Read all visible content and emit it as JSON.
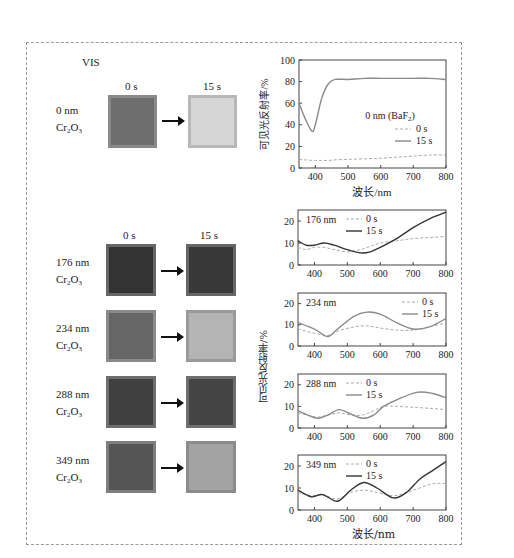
{
  "figure": {
    "mode_label": "VIS",
    "time_labels": {
      "t0": "0 s",
      "t1": "15 s"
    },
    "material": "Cr2O3",
    "material_main": "Cr",
    "material_sub1": "2",
    "material_mid": "O",
    "material_sub2": "3",
    "samples": [
      {
        "thickness": "0 nm",
        "before_color": "#6e6e6e",
        "before_border": "#8a8a8a",
        "after_color": "#d6d6d6",
        "after_border": "#b8b8b8"
      },
      {
        "thickness": "176 nm",
        "before_color": "#333333",
        "before_border": "#666666",
        "after_color": "#383838",
        "after_border": "#666666"
      },
      {
        "thickness": "234 nm",
        "before_color": "#666666",
        "before_border": "#8a8a8a",
        "after_color": "#b4b4b4",
        "after_border": "#9a9a9a"
      },
      {
        "thickness": "288 nm",
        "before_color": "#404040",
        "before_border": "#6e6e6e",
        "after_color": "#444444",
        "after_border": "#6e6e6e"
      },
      {
        "thickness": "349 nm",
        "before_color": "#555555",
        "before_border": "#7e7e7e",
        "after_color": "#a3a3a3",
        "after_border": "#8c8c8c"
      }
    ],
    "ylabel": "可见光反射率/%",
    "xlabel": "波长/nm"
  },
  "chart_data": [
    {
      "type": "line",
      "title": "0 nm (BaF2)",
      "title_main": "0 nm (BaF",
      "title_sub": "2",
      "title_end": ")",
      "xlabel": "波长/nm",
      "ylabel": "可见光反射率/%",
      "xlim": [
        350,
        800
      ],
      "ylim": [
        0,
        100
      ],
      "xticks": [
        "400",
        "500",
        "600",
        "700",
        "800"
      ],
      "yticks": [
        "0",
        "20",
        "40",
        "60",
        "80",
        "100"
      ],
      "x": [
        350,
        370,
        390,
        400,
        420,
        440,
        460,
        500,
        550,
        600,
        650,
        700,
        750,
        800
      ],
      "series": [
        {
          "name": "0 s",
          "style": "dashed",
          "values": [
            8,
            7.5,
            7,
            7,
            7,
            7,
            7.5,
            8,
            8.5,
            9,
            10,
            11,
            12,
            12
          ]
        },
        {
          "name": "15 s",
          "style": "solid",
          "values": [
            60,
            45,
            34,
            40,
            65,
            78,
            82,
            82,
            83,
            83,
            83,
            83,
            83,
            82
          ]
        }
      ],
      "legend": [
        "0 s",
        "15 s"
      ]
    },
    {
      "type": "line",
      "title": "176 nm",
      "xlim": [
        350,
        800
      ],
      "ylim": [
        0,
        25
      ],
      "xticks": [
        "400",
        "500",
        "600",
        "700",
        "800"
      ],
      "yticks": [
        "0",
        "10",
        "20"
      ],
      "x": [
        350,
        375,
        400,
        430,
        460,
        500,
        540,
        570,
        600,
        650,
        700,
        750,
        800
      ],
      "series": [
        {
          "name": "0 s",
          "style": "dashed",
          "values": [
            8,
            7,
            8,
            8,
            7,
            6,
            7,
            8.5,
            10,
            11,
            12,
            12.5,
            13
          ]
        },
        {
          "name": "15 s",
          "style": "solid",
          "values": [
            11,
            9,
            9,
            10,
            9,
            7,
            5.5,
            6,
            8,
            12,
            17,
            21,
            24
          ]
        }
      ],
      "legend": [
        "0 s",
        "15 s"
      ]
    },
    {
      "type": "line",
      "title": "234 nm",
      "xlim": [
        350,
        800
      ],
      "ylim": [
        0,
        25
      ],
      "xticks": [
        "400",
        "500",
        "600",
        "700",
        "800"
      ],
      "yticks": [
        "0",
        "10",
        "20"
      ],
      "x": [
        350,
        400,
        440,
        470,
        520,
        560,
        600,
        650,
        700,
        750,
        800
      ],
      "series": [
        {
          "name": "0 s",
          "style": "dashed",
          "values": [
            8,
            6,
            5,
            7,
            9,
            9.5,
            8.5,
            7.5,
            7.5,
            9,
            11
          ]
        },
        {
          "name": "15 s",
          "style": "solid",
          "values": [
            11,
            8,
            4.5,
            8,
            14,
            16,
            15,
            11,
            8,
            9,
            13
          ]
        }
      ],
      "legend": [
        "0 s",
        "15 s"
      ]
    },
    {
      "type": "line",
      "title": "288 nm",
      "xlim": [
        350,
        800
      ],
      "ylim": [
        0,
        25
      ],
      "xticks": [
        "400",
        "500",
        "600",
        "700",
        "800"
      ],
      "yticks": [
        "0",
        "10",
        "20"
      ],
      "x": [
        350,
        380,
        410,
        440,
        475,
        510,
        545,
        580,
        610,
        650,
        710,
        760,
        800
      ],
      "series": [
        {
          "name": "0 s",
          "style": "dashed",
          "values": [
            7,
            6,
            5,
            6,
            7,
            6,
            6,
            8,
            10,
            10,
            9.5,
            9,
            8.5
          ]
        },
        {
          "name": "15 s",
          "style": "solid",
          "values": [
            8,
            6,
            4.5,
            6,
            8.5,
            6.5,
            4.5,
            6,
            10,
            13,
            16.5,
            16,
            14
          ]
        }
      ],
      "legend": [
        "0 s",
        "15 s"
      ]
    },
    {
      "type": "line",
      "title": "349 nm",
      "xlim": [
        350,
        800
      ],
      "ylim": [
        0,
        25
      ],
      "xticks": [
        "400",
        "500",
        "600",
        "700",
        "800"
      ],
      "yticks": [
        "0",
        "10",
        "20"
      ],
      "x": [
        350,
        390,
        425,
        470,
        510,
        550,
        590,
        640,
        680,
        720,
        760,
        800
      ],
      "series": [
        {
          "name": "0 s",
          "style": "dashed",
          "values": [
            8,
            6.5,
            7,
            5,
            8,
            9,
            8,
            6.5,
            8,
            10,
            12,
            12
          ]
        },
        {
          "name": "15 s",
          "style": "solid",
          "values": [
            9,
            6,
            7,
            4,
            9,
            12.5,
            10,
            5.5,
            8,
            14,
            18,
            22
          ]
        }
      ],
      "legend": [
        "0 s",
        "15 s"
      ]
    }
  ]
}
